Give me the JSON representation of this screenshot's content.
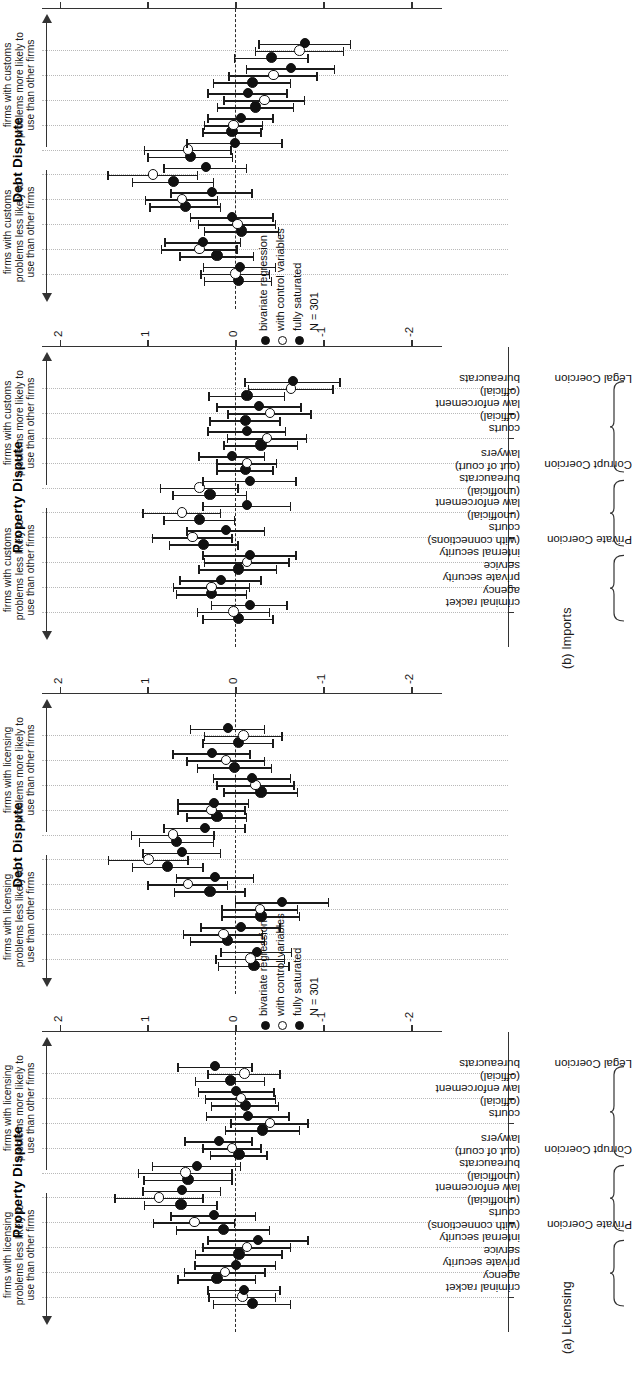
{
  "figure": {
    "subfigures": [
      {
        "key": "licensing",
        "label": "(a) Licensing"
      },
      {
        "key": "imports",
        "label": "(b) Imports"
      }
    ]
  },
  "axis": {
    "ticks": [
      "-2",
      "-1",
      "0",
      "1",
      "2"
    ],
    "tick_values": [
      -2,
      -1,
      0,
      1,
      2
    ],
    "limits": [
      -2.35,
      2.2
    ]
  },
  "categories": [
    "criminal racket",
    "private security agency",
    "internal security service",
    "courts (with connections)",
    "law enforcement (unofficial)",
    "bureaucrats (unofficial)",
    "lawyers (out of court)",
    "courts",
    "law enforcement (official)",
    "bureaucrats (official)"
  ],
  "category_lines": [
    [
      "criminal racket",
      ""
    ],
    [
      "private security",
      "agency"
    ],
    [
      "internal security",
      "service"
    ],
    [
      "courts",
      "(with connections)"
    ],
    [
      "law enforcement",
      "(unofficial)"
    ],
    [
      "bureaucrats",
      "(unofficial)"
    ],
    [
      "lawyers",
      "(out of court)"
    ],
    [
      "courts",
      ""
    ],
    [
      "law enforcement",
      "(official)"
    ],
    [
      "bureaucrats",
      "(official)"
    ]
  ],
  "groups": [
    {
      "label": "Private Coercion",
      "start": 0,
      "end": 2
    },
    {
      "label": "Corrupt Coercion",
      "start": 3,
      "end": 5
    },
    {
      "label": "Legal Coercion",
      "start": 6,
      "end": 9
    }
  ],
  "legend": {
    "items": [
      {
        "label": "bivariate regression",
        "marker": "filled"
      },
      {
        "label": "with control variables",
        "marker": "hollow"
      },
      {
        "label": "fully saturated",
        "marker": "filled"
      }
    ],
    "n_label": "N = 301"
  },
  "panel_titles": {
    "property": "Property Dispute",
    "debt": "Debt Dispute"
  },
  "annotations": {
    "licensing_less": "firms with licensing\nproblems less likely to\nuse than other firms",
    "licensing_more": "firms with licensing\nproblems more likely to\nuse than other firms",
    "customs_less": "firms with customs\nproblems less likely to\nuse than other firms",
    "customs_more": "firms with customs\nproblems more likely to\nuse than other firms",
    "licensing_less_lines": [
      "firms with licensing",
      "problems less likely to",
      "use than other firms"
    ],
    "licensing_more_lines": [
      "firms with licensing",
      "problems more likely to",
      "use than other firms"
    ],
    "customs_less_lines": [
      "firms with customs",
      "problems less likely to",
      "use than other firms"
    ],
    "customs_more_lines": [
      "firms with customs",
      "problems more likely to",
      "use than other firms"
    ]
  },
  "chart_data": {
    "type": "scatter",
    "title": "",
    "xlabel": "",
    "ylabel": "coefficient estimate",
    "ylim": [
      -2.35,
      2.2
    ],
    "grid": true,
    "legend_position": "center",
    "series_names": [
      "bivariate regression",
      "with control variables",
      "fully saturated"
    ],
    "categories": [
      "criminal racket",
      "private security agency",
      "internal security service",
      "courts (with connections)",
      "law enforcement (unofficial)",
      "bureaucrats (unofficial)",
      "lawyers (out of court)",
      "courts",
      "law enforcement (official)",
      "bureaucrats (official)"
    ],
    "panels": [
      {
        "subfigure": "(a) Licensing",
        "panel": "Property Dispute",
        "n": 301,
        "series": [
          {
            "name": "bivariate regression",
            "estimates": [
              -0.18,
              0.22,
              -0.03,
              0.15,
              0.63,
              0.55,
              -0.03,
              -0.3,
              -0.1,
              0.07
            ],
            "ci_low": [
              -0.62,
              -0.22,
              -0.52,
              -0.38,
              0.22,
              0.05,
              -0.35,
              -0.72,
              -0.48,
              -0.32
            ],
            "ci_high": [
              0.26,
              0.66,
              0.46,
              0.68,
              1.04,
              1.05,
              0.29,
              0.12,
              0.28,
              0.46
            ]
          },
          {
            "name": "with control variables",
            "estimates": [
              -0.07,
              0.13,
              -0.12,
              0.48,
              0.88,
              0.58,
              0.05,
              -0.38,
              -0.05,
              -0.09
            ],
            "ci_low": [
              -0.45,
              -0.33,
              -0.62,
              0.02,
              0.38,
              0.05,
              -0.28,
              -0.82,
              -0.45,
              -0.5
            ],
            "ci_high": [
              0.31,
              0.59,
              0.38,
              0.94,
              1.38,
              1.11,
              0.38,
              0.06,
              0.35,
              0.32
            ]
          },
          {
            "name": "fully saturated",
            "estimates": [
              -0.09,
              0.01,
              -0.25,
              0.26,
              0.62,
              0.45,
              0.2,
              -0.13,
              0.0,
              0.24
            ],
            "ci_low": [
              -0.5,
              -0.45,
              -0.82,
              -0.22,
              0.18,
              -0.05,
              -0.18,
              -0.6,
              -0.43,
              -0.18
            ],
            "ci_high": [
              0.32,
              0.47,
              0.32,
              0.74,
              1.06,
              0.95,
              0.58,
              0.34,
              0.43,
              0.66
            ]
          }
        ]
      },
      {
        "subfigure": "(a) Licensing",
        "panel": "Debt Dispute",
        "n": 301,
        "series": [
          {
            "name": "bivariate regression",
            "estimates": [
              -0.2,
              0.1,
              -0.28,
              0.3,
              0.78,
              0.68,
              0.22,
              -0.28,
              0.02,
              -0.02
            ],
            "ci_low": [
              -0.6,
              -0.32,
              -0.72,
              -0.1,
              0.38,
              0.26,
              -0.12,
              -0.7,
              -0.4,
              -0.42
            ],
            "ci_high": [
              0.2,
              0.52,
              0.16,
              0.7,
              1.18,
              1.1,
              0.56,
              0.14,
              0.44,
              0.38
            ]
          },
          {
            "name": "with control variables",
            "estimates": [
              -0.16,
              0.15,
              -0.27,
              0.55,
              1.0,
              0.72,
              0.28,
              -0.22,
              0.12,
              -0.08
            ],
            "ci_low": [
              -0.55,
              -0.3,
              -0.7,
              0.1,
              0.55,
              0.25,
              -0.1,
              -0.66,
              -0.32,
              -0.52
            ],
            "ci_high": [
              0.23,
              0.6,
              0.16,
              1.0,
              1.45,
              1.19,
              0.66,
              0.22,
              0.56,
              0.36
            ]
          },
          {
            "name": "fully saturated",
            "estimates": [
              -0.23,
              -0.05,
              -0.52,
              0.24,
              0.62,
              0.36,
              0.26,
              -0.18,
              0.28,
              0.1
            ],
            "ci_low": [
              -0.63,
              -0.5,
              -1.05,
              -0.2,
              0.18,
              -0.1,
              -0.14,
              -0.62,
              -0.16,
              -0.32
            ],
            "ci_high": [
              0.17,
              0.4,
              0.01,
              0.68,
              1.06,
              0.82,
              0.66,
              0.26,
              0.72,
              0.52
            ]
          }
        ]
      },
      {
        "subfigure": "(b) Imports",
        "panel": "Property Dispute",
        "n": 301,
        "series": [
          {
            "name": "bivariate regression",
            "estimates": [
              -0.02,
              0.28,
              -0.02,
              0.37,
              0.42,
              0.3,
              -0.1,
              -0.28,
              -0.1,
              -0.12
            ],
            "ci_low": [
              -0.42,
              -0.12,
              -0.46,
              -0.02,
              0.02,
              -0.12,
              -0.42,
              -0.7,
              -0.5,
              -0.55
            ],
            "ci_high": [
              0.38,
              0.68,
              0.42,
              0.76,
              0.82,
              0.72,
              0.22,
              0.14,
              0.3,
              0.31
            ]
          },
          {
            "name": "with control variables",
            "estimates": [
              0.03,
              0.28,
              -0.12,
              0.5,
              0.62,
              0.42,
              -0.12,
              -0.35,
              -0.38,
              -0.62
            ],
            "ci_low": [
              -0.38,
              -0.15,
              -0.6,
              0.05,
              0.18,
              -0.02,
              -0.46,
              -0.8,
              -0.85,
              -1.1
            ],
            "ci_high": [
              0.44,
              0.71,
              0.36,
              0.95,
              1.06,
              0.86,
              0.22,
              0.1,
              0.09,
              -0.14
            ]
          },
          {
            "name": "fully saturated",
            "estimates": [
              -0.15,
              0.18,
              -0.15,
              0.12,
              -0.12,
              -0.15,
              0.05,
              -0.12,
              -0.26,
              -0.64
            ],
            "ci_low": [
              -0.58,
              -0.28,
              -0.68,
              -0.32,
              -0.62,
              -0.68,
              -0.32,
              -0.56,
              -0.74,
              -1.18
            ],
            "ci_high": [
              0.28,
              0.64,
              0.38,
              0.56,
              0.38,
              0.38,
              0.42,
              0.32,
              0.22,
              -0.1
            ]
          }
        ]
      },
      {
        "subfigure": "(b) Imports",
        "panel": "Debt Dispute",
        "n": 301,
        "series": [
          {
            "name": "bivariate regression",
            "estimates": [
              -0.02,
              0.22,
              -0.06,
              0.58,
              0.72,
              0.52,
              0.05,
              -0.22,
              -0.18,
              -0.4
            ],
            "ci_low": [
              -0.4,
              -0.2,
              -0.48,
              0.18,
              0.26,
              0.04,
              -0.28,
              -0.65,
              -0.62,
              -0.82
            ],
            "ci_high": [
              0.36,
              0.64,
              0.36,
              0.98,
              1.18,
              1.0,
              0.38,
              0.21,
              0.26,
              0.02
            ]
          },
          {
            "name": "with control variables",
            "estimates": [
              0.01,
              0.42,
              -0.01,
              0.62,
              0.95,
              0.55,
              0.03,
              -0.32,
              -0.42,
              -0.72
            ],
            "ci_low": [
              -0.38,
              -0.01,
              -0.45,
              0.21,
              0.44,
              0.06,
              -0.3,
              -0.78,
              -0.92,
              -1.22
            ],
            "ci_high": [
              0.4,
              0.85,
              0.43,
              1.03,
              1.46,
              1.04,
              0.36,
              0.14,
              0.08,
              -0.22
            ]
          },
          {
            "name": "fully saturated",
            "estimates": [
              -0.04,
              0.38,
              0.05,
              0.28,
              0.35,
              0.02,
              -0.05,
              -0.13,
              -0.62,
              -0.78
            ],
            "ci_low": [
              -0.45,
              -0.05,
              -0.42,
              -0.18,
              -0.12,
              -0.52,
              -0.42,
              -0.58,
              -1.12,
              -1.3
            ],
            "ci_high": [
              0.37,
              0.81,
              0.52,
              0.74,
              0.82,
              0.56,
              0.32,
              0.32,
              -0.12,
              -0.26
            ]
          }
        ]
      }
    ]
  }
}
